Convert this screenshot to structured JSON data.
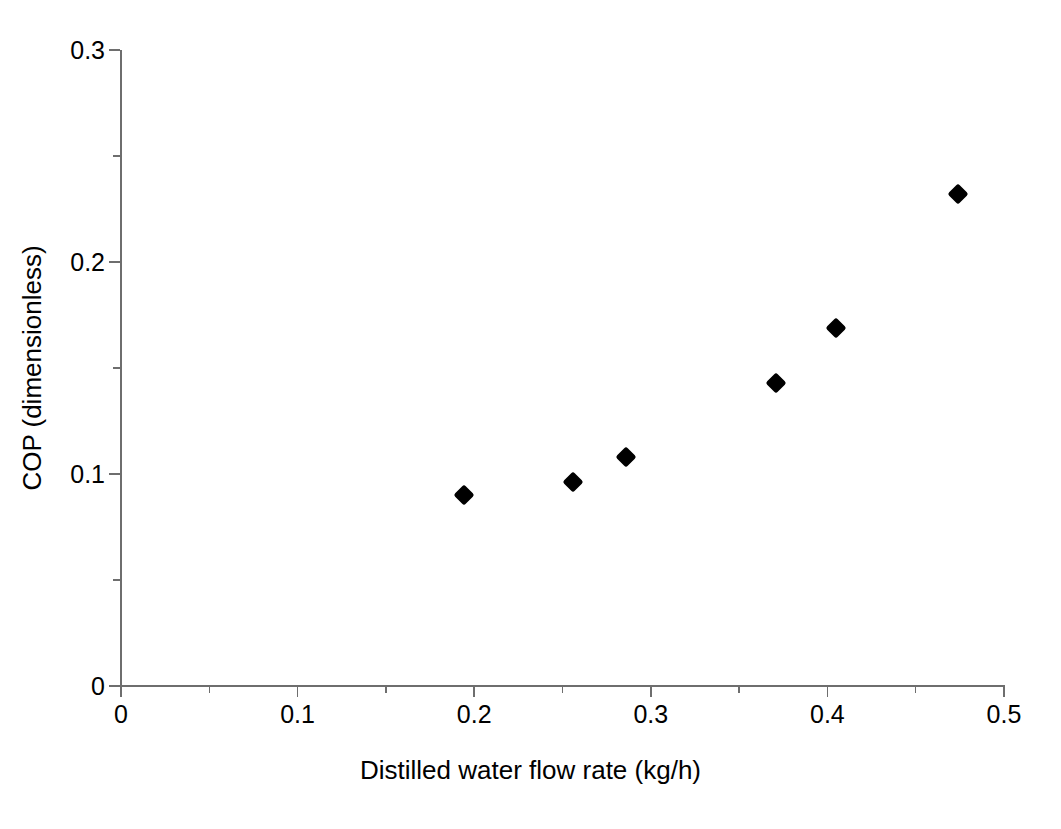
{
  "chart_data": {
    "type": "scatter",
    "title": "",
    "xlabel": "Distilled water flow rate (kg/h)",
    "ylabel": "COP (dimensionless)",
    "xlim": [
      0,
      0.5
    ],
    "ylim": [
      0,
      0.3
    ],
    "grid": false,
    "legend": null,
    "marker_style": "filled-diamond",
    "marker_color": "#000000",
    "x_major_ticks": [
      0,
      0.1,
      0.2,
      0.3,
      0.4,
      0.5
    ],
    "x_major_tick_labels": [
      "0",
      "0.1",
      "0.2",
      "0.3",
      "0.4",
      "0.5"
    ],
    "x_minor_ticks": [
      0.05,
      0.15,
      0.25,
      0.35,
      0.45
    ],
    "y_major_ticks": [
      0,
      0.1,
      0.2,
      0.3
    ],
    "y_major_tick_labels": [
      "0",
      "0.1",
      "0.2",
      "0.3"
    ],
    "y_minor_ticks": [
      0.05,
      0.15,
      0.25
    ],
    "x": [
      0.194,
      0.256,
      0.286,
      0.371,
      0.405,
      0.474
    ],
    "values": [
      0.09,
      0.096,
      0.108,
      0.143,
      0.169,
      0.232
    ],
    "points": [
      {
        "x": 0.194,
        "y": 0.09
      },
      {
        "x": 0.256,
        "y": 0.096
      },
      {
        "x": 0.286,
        "y": 0.108
      },
      {
        "x": 0.371,
        "y": 0.143
      },
      {
        "x": 0.405,
        "y": 0.169
      },
      {
        "x": 0.474,
        "y": 0.232
      }
    ]
  },
  "axes": {
    "axis_color": "#6e6e6e",
    "background": "#ffffff"
  }
}
